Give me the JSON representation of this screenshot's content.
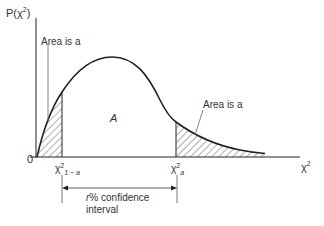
{
  "diagram": {
    "type": "chi-squared distribution confidence interval",
    "y_axis_label": "P(χ²)",
    "y_axis_label_base": "P(χ",
    "y_axis_label_sup": "2",
    "y_axis_label_close": ")",
    "x_axis_label": "χ²",
    "x_axis_label_base": "χ",
    "x_axis_label_sup": "2",
    "origin_label": "0",
    "left_area_label": "Area is a",
    "right_area_label": "Area is a",
    "center_area_label": "A",
    "left_critical_label": "χ²₁₋ₐ",
    "left_critical_base": "χ",
    "left_critical_sup": "2",
    "left_critical_sub": "1 − a",
    "right_critical_label": "χ²ₐ",
    "right_critical_base": "χ",
    "right_critical_sup": "2",
    "right_critical_sub": "a",
    "interval_label_line1_italic": "r",
    "interval_label_line1_rest": "% confidence",
    "interval_label_line2": "interval",
    "colors": {
      "line": "#222222",
      "hatch": "#333333",
      "background": "#ffffff"
    }
  }
}
